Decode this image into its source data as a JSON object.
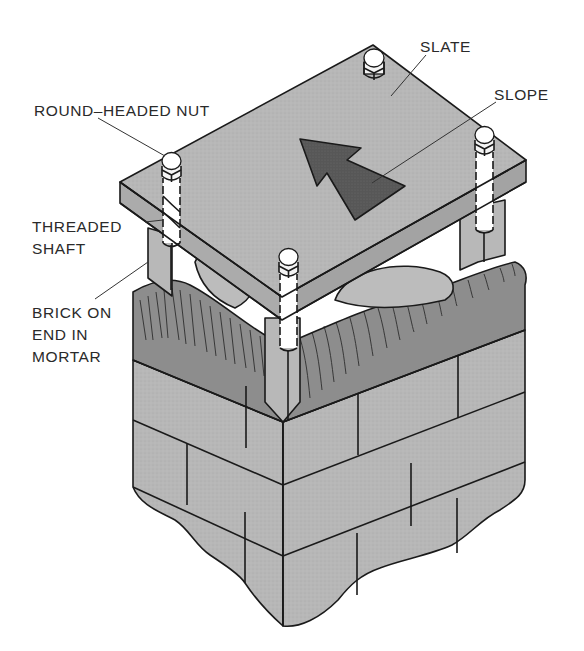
{
  "figure": {
    "labels": {
      "slate": "SLATE",
      "slope": "SLOPE",
      "round_headed_nut": "ROUND–HEADED NUT",
      "threaded_shaft_line1": "THREADED",
      "threaded_shaft_line2": "SHAFT",
      "brick_line1": "BRICK ON",
      "brick_line2": "END IN",
      "brick_line3": "MORTAR"
    },
    "colors": {
      "slate_top": "#b9b9b9",
      "slate_edge": "#a9a9a9",
      "brick": "#b5b5b5",
      "brick_shade": "#a8a8a8",
      "mortar": "#8a8a8a",
      "arrow": "#5a5a5a",
      "line": "#1a1a1a",
      "shaft": "#ffffff"
    },
    "components": [
      "slate slab",
      "slope arrow",
      "4 round-headed nuts",
      "4 threaded shafts",
      "bricks on end in mortar",
      "brick pier (running bond)"
    ]
  }
}
